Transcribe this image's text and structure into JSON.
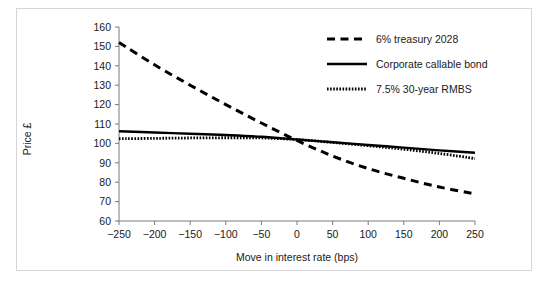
{
  "chart_data": {
    "type": "line",
    "title": "",
    "xlabel": "Move in interest rate (bps)",
    "ylabel": "Price £",
    "xlim": [
      -250,
      250
    ],
    "ylim": [
      60,
      160
    ],
    "xticks": [
      -250,
      -200,
      -150,
      -100,
      -50,
      0,
      50,
      100,
      150,
      200,
      250
    ],
    "yticks": [
      60,
      70,
      80,
      90,
      100,
      110,
      120,
      130,
      140,
      150,
      160
    ],
    "xtick_labels": [
      "−250",
      "−200",
      "−150",
      "−100",
      "−50",
      "0",
      "50",
      "100",
      "150",
      "200",
      "250"
    ],
    "ytick_labels": [
      "60",
      "70",
      "80",
      "90",
      "100",
      "110",
      "120",
      "130",
      "140",
      "150",
      "160"
    ],
    "grid": false,
    "legend_position": "top-right",
    "x": [
      -250,
      -200,
      -150,
      -100,
      -50,
      0,
      50,
      100,
      150,
      200,
      250
    ],
    "series": [
      {
        "name": "6% treasury 2028",
        "style": "dashed",
        "color": "#000000",
        "values": [
          152.0,
          140.5,
          130.0,
          120.0,
          110.5,
          101.5,
          93.5,
          87.0,
          82.0,
          77.5,
          74.0
        ]
      },
      {
        "name": "Corporate callable bond",
        "style": "solid",
        "color": "#000000",
        "values": [
          106.3,
          105.6,
          105.0,
          104.3,
          103.4,
          102.0,
          100.6,
          99.2,
          97.8,
          96.4,
          95.2
        ]
      },
      {
        "name": "7.5% 30-year RMBS",
        "style": "dotted",
        "color": "#000000",
        "values": [
          102.4,
          102.6,
          102.8,
          102.9,
          102.8,
          102.0,
          100.5,
          98.8,
          97.0,
          94.8,
          92.2
        ]
      }
    ]
  },
  "axes": {
    "y_title": "Price £",
    "x_title": "Move in interest rate (bps)"
  },
  "legend": {
    "entries": [
      {
        "label": "6% treasury 2028",
        "style": "dashed"
      },
      {
        "label": "Corporate callable bond",
        "style": "solid"
      },
      {
        "label": "7.5% 30-year RMBS",
        "style": "dotted"
      }
    ]
  },
  "colors": {
    "line": "#000000",
    "axis": "#7a7a7a",
    "text": "#1a1a1a",
    "frame": "#d6d6d6",
    "background": "#ffffff"
  }
}
